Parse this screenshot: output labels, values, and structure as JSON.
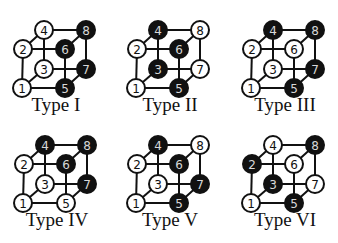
{
  "figure": {
    "colors": {
      "black": "#111111",
      "white": "#ffffff",
      "line": "#111111"
    },
    "edges": [
      [
        1,
        2
      ],
      [
        1,
        3
      ],
      [
        1,
        5
      ],
      [
        2,
        4
      ],
      [
        2,
        6
      ],
      [
        3,
        4
      ],
      [
        3,
        7
      ],
      [
        4,
        8
      ],
      [
        5,
        6
      ],
      [
        5,
        7
      ],
      [
        6,
        8
      ],
      [
        7,
        8
      ]
    ],
    "vertices": [
      1,
      2,
      3,
      4,
      5,
      6,
      7,
      8
    ],
    "cubes": [
      {
        "label": "Type I",
        "black": [
          5,
          6,
          7,
          8
        ],
        "white": [
          1,
          2,
          3,
          4
        ]
      },
      {
        "label": "Type II",
        "black": [
          3,
          4,
          5,
          6
        ],
        "white": [
          1,
          2,
          7,
          8
        ]
      },
      {
        "label": "Type III",
        "black": [
          4,
          5,
          7,
          8
        ],
        "white": [
          1,
          2,
          3,
          6
        ]
      },
      {
        "label": "Type IV",
        "black": [
          4,
          6,
          7,
          8
        ],
        "white": [
          1,
          2,
          3,
          5
        ]
      },
      {
        "label": "Type V",
        "black": [
          4,
          5,
          6,
          7
        ],
        "white": [
          1,
          2,
          3,
          8
        ]
      },
      {
        "label": "Type VI",
        "black": [
          2,
          3,
          5,
          8
        ],
        "white": [
          1,
          4,
          6,
          7
        ]
      }
    ]
  }
}
